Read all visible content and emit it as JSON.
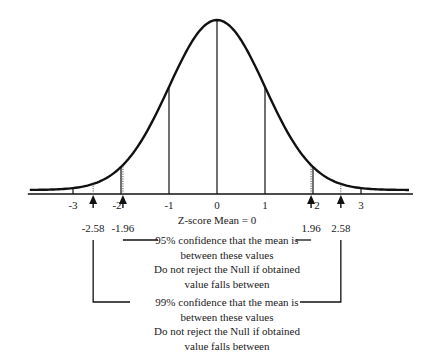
{
  "chart_data": {
    "type": "line",
    "title": "",
    "xlabel": "Z-score Mean = 0",
    "ylabel": "",
    "distribution": "standard normal",
    "mean": 0,
    "sd": 1,
    "xlim": [
      -3.9,
      4.0
    ],
    "ticks": [
      {
        "value": -3,
        "label": "-3"
      },
      {
        "value": -2,
        "label": "-2"
      },
      {
        "value": -1,
        "label": "-1"
      },
      {
        "value": 0,
        "label": "0"
      },
      {
        "value": 1,
        "label": "1"
      },
      {
        "value": 2,
        "label": "2"
      },
      {
        "value": 3,
        "label": "3"
      }
    ],
    "critical_values": [
      {
        "value": -2.58,
        "label": "-2.58",
        "style": "dotted"
      },
      {
        "value": -1.96,
        "label": "-1.96",
        "style": "dotted"
      },
      {
        "value": 1.96,
        "label": "1.96",
        "style": "dotted"
      },
      {
        "value": 2.58,
        "label": "2.58",
        "style": "dotted"
      }
    ],
    "annotations": [
      {
        "range": [
          -1.96,
          1.96
        ],
        "lines": [
          "95% confidence that the mean is",
          "between these values",
          "Do not reject the Null if obtained",
          "value falls between"
        ]
      },
      {
        "range": [
          -2.58,
          2.58
        ],
        "lines": [
          "99% confidence that the mean is",
          "between these values",
          "Do not reject the Null if obtained",
          "value falls between"
        ]
      }
    ],
    "colors": {
      "line": "#111111",
      "text": "#1a1a1a",
      "background": "#ffffff"
    }
  }
}
